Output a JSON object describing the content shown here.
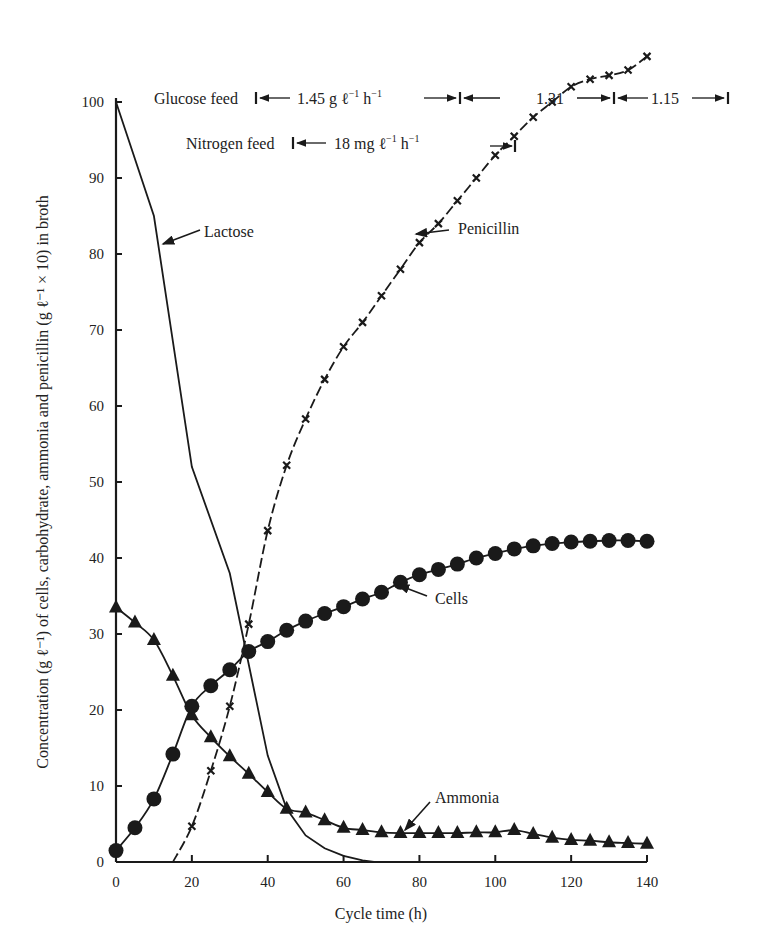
{
  "chart_data": {
    "type": "line",
    "title": "",
    "xlabel": "Cycle time (h)",
    "ylabel": "Concentration (g ℓ⁻¹) of cells, carbohydrate, ammonia and penicillin (g ℓ⁻¹ × 10) in broth",
    "xlim": [
      0,
      140
    ],
    "ylim": [
      0,
      100
    ],
    "x_ticks": [
      0,
      20,
      40,
      60,
      80,
      100,
      120,
      140
    ],
    "y_ticks": [
      0,
      10,
      20,
      30,
      40,
      50,
      60,
      70,
      80,
      90,
      100
    ],
    "grid": false,
    "legend": "inline labels with arrows",
    "series": [
      {
        "name": "Lactose",
        "marker": "none",
        "x": [
          0,
          10,
          20,
          30,
          40,
          45,
          50,
          55,
          60,
          65,
          68
        ],
        "values": [
          100,
          85,
          52,
          38,
          14,
          7,
          3.5,
          1.8,
          0.8,
          0.2,
          0
        ]
      },
      {
        "name": "Penicillin",
        "marker": "x",
        "line": "dashed",
        "x": [
          15,
          20,
          25,
          30,
          35,
          40,
          45,
          50,
          55,
          60,
          65,
          70,
          75,
          80,
          85,
          90,
          95,
          100,
          105,
          110,
          115,
          120,
          125,
          130,
          135,
          140
        ],
        "values": [
          0,
          4.7,
          12,
          20.5,
          31.3,
          43.6,
          52.2,
          58.3,
          63.5,
          67.8,
          71,
          74.5,
          78,
          81.5,
          84,
          87,
          90,
          93,
          95.5,
          98,
          100,
          102,
          103,
          103.5,
          104.2,
          106
        ]
      },
      {
        "name": "Cells",
        "marker": "circle",
        "x": [
          0,
          5,
          10,
          15,
          20,
          25,
          30,
          35,
          40,
          45,
          50,
          55,
          60,
          65,
          70,
          75,
          80,
          85,
          90,
          95,
          100,
          105,
          110,
          115,
          120,
          125,
          130,
          135,
          140
        ],
        "values": [
          1.5,
          4.5,
          8.3,
          14.2,
          20.5,
          23.2,
          25.3,
          27.7,
          29,
          30.5,
          31.7,
          32.7,
          33.6,
          34.6,
          35.5,
          36.8,
          37.8,
          38.5,
          39.2,
          40,
          40.6,
          41.2,
          41.6,
          41.9,
          42.1,
          42.2,
          42.3,
          42.3,
          42.2
        ]
      },
      {
        "name": "Ammonia",
        "marker": "triangle",
        "x": [
          0,
          5,
          10,
          15,
          20,
          25,
          30,
          35,
          40,
          45,
          50,
          55,
          60,
          65,
          70,
          75,
          80,
          85,
          90,
          95,
          100,
          105,
          110,
          115,
          120,
          125,
          130,
          135,
          140
        ],
        "values": [
          33.5,
          31.5,
          29.2,
          24.5,
          19.3,
          16.4,
          13.9,
          11.6,
          9.2,
          7,
          6.5,
          5.5,
          4.5,
          4.2,
          3.9,
          3.8,
          3.8,
          3.8,
          3.8,
          3.9,
          3.9,
          4.2,
          3.7,
          3.2,
          2.9,
          2.8,
          2.6,
          2.5,
          2.4
        ]
      }
    ],
    "annotations": [
      {
        "text": "Lactose",
        "target": "Lactose curve near x≈11, y≈78"
      },
      {
        "text": "Penicillin",
        "target": "Penicillin curve near x≈75, y≈78"
      },
      {
        "text": "Cells",
        "target": "Cells curve near x≈75, y≈37"
      },
      {
        "text": "Ammonia",
        "target": "Ammonia curve near x≈74, y≈4"
      },
      {
        "text": "Glucose feed ← 1.45 g ℓ⁻¹ h⁻¹ → | ← 1.31 → | ← 1.15 →",
        "segments": [
          [
            0,
            90,
            1.45
          ],
          [
            90,
            130,
            1.31
          ],
          [
            130,
            140,
            1.15
          ]
        ]
      },
      {
        "text": "Nitrogen feed ← 18 mg ℓ⁻¹ h⁻¹ →",
        "segments": [
          [
            0,
            105,
            18
          ]
        ]
      }
    ]
  },
  "labels": {
    "x_axis_title": "Cycle time (h)",
    "y_axis_title": "Concentration (g ℓ⁻¹) of cells, carbohydrate, ammonia and penicillin (g ℓ⁻¹ × 10) in broth",
    "lactose": "Lactose",
    "penicillin": "Penicillin",
    "cells": "Cells",
    "ammonia": "Ammonia",
    "glucose_feed": "Glucose feed",
    "glucose_rate_1": "1.45 g ℓ",
    "glucose_rate_1_unit": "h",
    "glucose_rate_2": "1.31",
    "glucose_rate_3": "1.15",
    "nitrogen_feed": "Nitrogen feed",
    "nitrogen_rate": "18 mg ℓ",
    "nitrogen_rate_unit": "h",
    "minus_one": "−1"
  },
  "style": {
    "ink": "#1a1a1a",
    "background": "#ffffff"
  }
}
